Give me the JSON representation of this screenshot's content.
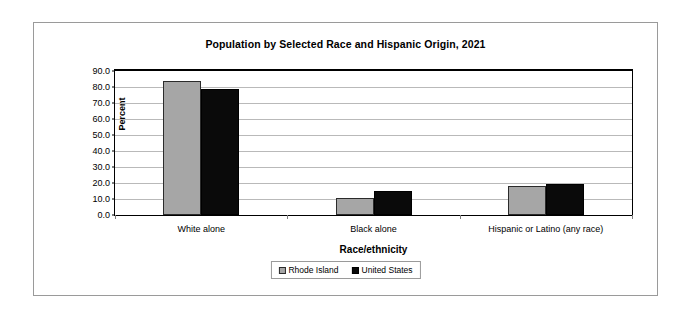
{
  "chart_data": {
    "type": "bar",
    "title": "Population by Selected Race and Hispanic Origin, 2021",
    "xlabel": "Race/ethnicity",
    "ylabel": "Percent",
    "ylim": [
      0,
      90
    ],
    "ytick_labels": [
      "90.0",
      "80.0",
      "70.0",
      "60.0",
      "50.0",
      "40.0",
      "30.0",
      "20.0",
      "10.0",
      "0.0"
    ],
    "ytick_values": [
      90,
      80,
      70,
      60,
      50,
      40,
      30,
      20,
      10,
      0
    ],
    "grid": true,
    "legend_position": "bottom",
    "categories": [
      "White alone",
      "Black alone",
      "Hispanic or Latino (any race)"
    ],
    "series": [
      {
        "name": "Rhode Island",
        "color": "#a6a6a6",
        "values": [
          84.0,
          10.5,
          18.0
        ]
      },
      {
        "name": "United States",
        "color": "#0a0a0a",
        "values": [
          79.0,
          15.0,
          19.5
        ]
      }
    ]
  }
}
